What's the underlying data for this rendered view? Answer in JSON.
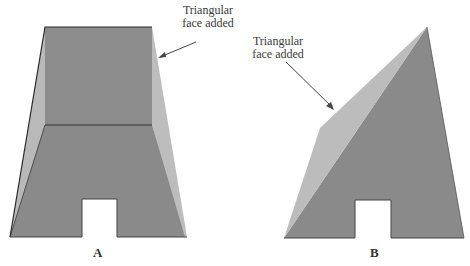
{
  "figures": [
    {
      "id": "A",
      "caption": "A",
      "annotation": {
        "line1": "Triangular",
        "line2": "face added"
      }
    },
    {
      "id": "B",
      "caption": "B",
      "annotation": {
        "line1": "Triangular",
        "line2": "face added"
      }
    }
  ],
  "colors": {
    "dark_face": "#8a8a8a",
    "light_face": "#b9b9b9",
    "edge": "#333333",
    "background": "#ffffff"
  }
}
